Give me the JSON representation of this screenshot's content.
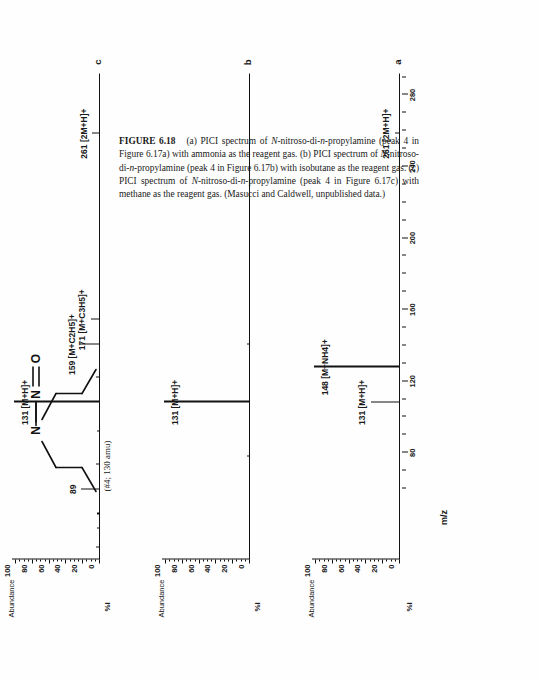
{
  "figure": {
    "label": "FIGURE 6.18",
    "caption_segments": [
      {
        "text": "(a) PICI spectrum of ",
        "style": "normal"
      },
      {
        "text": "N",
        "style": "italic"
      },
      {
        "text": "-nitroso-di-",
        "style": "normal"
      },
      {
        "text": "n",
        "style": "italic"
      },
      {
        "text": "-propylamine (peak 4 in Figure 6.17a) with ammonia as the reagent gas. (b) PICI spectrum of ",
        "style": "normal"
      },
      {
        "text": "N",
        "style": "italic"
      },
      {
        "text": "-nitroso-di-",
        "style": "normal"
      },
      {
        "text": "n",
        "style": "italic"
      },
      {
        "text": "-propylamine (peak 4 in Figure 6.17b) with isobutane as the reagent gas. (c) PICI spectrum of ",
        "style": "normal"
      },
      {
        "text": "N",
        "style": "italic"
      },
      {
        "text": "-nitroso-di-",
        "style": "normal"
      },
      {
        "text": "n",
        "style": "italic"
      },
      {
        "text": "-propylamine (peak 4 in Figure 6.17c) with methane as the reagent gas. (Masucci and Caldwell, unpublished data.)",
        "style": "normal"
      }
    ],
    "caption_plain": "FIGURE 6.18   (a) PICI spectrum of N-nitroso-di-n-propylamine (peak 4 in Figure 6.17a) with ammonia as the reagent gas. (b) PICI spectrum of N-nitroso-di-n-propylamine (peak 4 in Figure 6.17b) with isobutane as the reagent gas. (c) PICI spectrum of N-nitroso-di-n-propylamine (peak 4 in Figure 6.17c) with methane as the reagent gas. (Masucci and Caldwell, unpublished data.)"
  },
  "structure": {
    "name": "N-nitroso-di-n-propylamine",
    "mass_annotation": "(#4; 130 amu)",
    "atoms": [
      "N",
      "N",
      "O"
    ],
    "bond_labels": {
      "amine_n": "N",
      "nitroso_n": "N",
      "oxygen": "O"
    }
  },
  "axes": {
    "y_title": "Abundance",
    "y_unit": "%I",
    "y_ticks": [
      0,
      20,
      40,
      60,
      80,
      100
    ],
    "y_tick_labels": [
      "0",
      "20",
      "40",
      "60",
      "80",
      "100"
    ],
    "y_range": [
      0,
      105
    ],
    "x_title": "m/z",
    "x_ticks": [
      80,
      120,
      160,
      200,
      240,
      280
    ],
    "x_tick_labels": [
      "80",
      "120",
      "160",
      "200",
      "240",
      "280"
    ],
    "x_minor_step": 20,
    "x_range": [
      55,
      292
    ]
  },
  "chart_data": [
    {
      "id": "a",
      "type": "bar",
      "panel_letter": "a",
      "title": "PICI spectrum of N-nitroso-di-n-propylamine with ammonia reagent gas",
      "reagent_gas": "ammonia",
      "xlabel": "m/z",
      "ylabel": "Abundance  %I",
      "xlim": [
        55,
        292
      ],
      "ylim": [
        0,
        105
      ],
      "grid": false,
      "x": [
        131,
        148,
        261
      ],
      "values": [
        34,
        100,
        6
      ],
      "annotations": [
        {
          "mz": 131,
          "label": "131  [M+H]+",
          "text_mz": "131",
          "text_assign": "[M+H]+"
        },
        {
          "mz": 148,
          "label": "148  [M+NH4]+",
          "text_mz": "148",
          "text_assign": "[M+NH4]+"
        },
        {
          "mz": 261,
          "label": "261  [2M+H]+",
          "text_mz": "261",
          "text_assign": "[2M+H]+"
        }
      ]
    },
    {
      "id": "b",
      "type": "bar",
      "panel_letter": "b",
      "title": "PICI spectrum of N-nitroso-di-n-propylamine with isobutane reagent gas",
      "reagent_gas": "isobutane",
      "xlabel": "m/z",
      "ylabel": "Abundance  %I",
      "xlim": [
        55,
        292
      ],
      "ylim": [
        0,
        105
      ],
      "grid": false,
      "x": [
        105,
        131,
        159
      ],
      "values": [
        4,
        100,
        3
      ],
      "annotations": [
        {
          "mz": 131,
          "label": "131  [M+H]+",
          "text_mz": "131",
          "text_assign": "[M+H]+"
        }
      ]
    },
    {
      "id": "c",
      "type": "bar",
      "panel_letter": "c",
      "title": "PICI spectrum of N-nitroso-di-n-propylamine with methane reagent gas",
      "reagent_gas": "methane",
      "xlabel": "m/z",
      "ylabel": "Abundance  %I",
      "xlim": [
        55,
        292
      ],
      "ylim": [
        0,
        105
      ],
      "grid": false,
      "x": [
        61,
        70,
        77,
        89,
        101,
        117,
        131,
        143,
        159,
        171,
        261
      ],
      "values": [
        5,
        3,
        4,
        22,
        5,
        4,
        100,
        5,
        23,
        11,
        9
      ],
      "annotations": [
        {
          "mz": 89,
          "label": "89",
          "text_mz": "89",
          "text_assign": ""
        },
        {
          "mz": 131,
          "label": "131  [M+H]+",
          "text_mz": "131",
          "text_assign": "[M+H]+"
        },
        {
          "mz": 159,
          "label": "159  [M+C2H5]+",
          "text_mz": "159",
          "text_assign": "[M+C2H5]+"
        },
        {
          "mz": 171,
          "label": "171  [M+C3H5]+",
          "text_mz": "171",
          "text_assign": "[M+C3H5]+"
        },
        {
          "mz": 261,
          "label": "261  [2M+H]+",
          "text_mz": "261",
          "text_assign": "[2M+H]+"
        }
      ]
    }
  ]
}
